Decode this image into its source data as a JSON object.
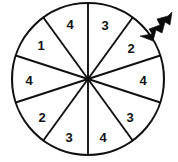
{
  "figure": {
    "name": "spinner-wheel",
    "background_color": "#ffffff",
    "line_color": "#111111",
    "fill_color": "#ffffff",
    "pointer": {
      "name": "arrow-pointer",
      "color": "#0b0b0b",
      "points_to_sector_index": 1,
      "points_to_value": "2",
      "direction": "down-left"
    }
  },
  "chart_data": {
    "type": "pie",
    "title": "",
    "xlabel": "",
    "ylabel": "",
    "legend": [],
    "grid": false,
    "center": {
      "x": 88,
      "y": 79
    },
    "radius": 76,
    "sector_count": 10,
    "categories": [
      "1",
      "2",
      "3",
      "4"
    ],
    "values": [
      1,
      2,
      3,
      4
    ],
    "counts": [
      1,
      2,
      3,
      4
    ],
    "labels_clockwise_from_top": [
      "3",
      "2",
      "4",
      "3",
      "4",
      "3",
      "2",
      "4",
      "1",
      "4"
    ],
    "sectors": [
      {
        "index": 0,
        "label": "3",
        "start_angle": 270,
        "end_angle": 306,
        "label_x": 105,
        "label_y": 25
      },
      {
        "index": 1,
        "label": "2",
        "start_angle": 306,
        "end_angle": 342,
        "label_x": 131,
        "label_y": 48
      },
      {
        "index": 2,
        "label": "4",
        "start_angle": 342,
        "end_angle": 18,
        "label_x": 143,
        "label_y": 80
      },
      {
        "index": 3,
        "label": "3",
        "start_angle": 18,
        "end_angle": 54,
        "label_x": 130,
        "label_y": 117
      },
      {
        "index": 4,
        "label": "4",
        "start_angle": 54,
        "end_angle": 90,
        "label_x": 103,
        "label_y": 137
      },
      {
        "index": 5,
        "label": "3",
        "start_angle": 90,
        "end_angle": 126,
        "label_x": 69,
        "label_y": 137
      },
      {
        "index": 6,
        "label": "2",
        "start_angle": 126,
        "end_angle": 162,
        "label_x": 42,
        "label_y": 117
      },
      {
        "index": 7,
        "label": "4",
        "start_angle": 162,
        "end_angle": 198,
        "label_x": 29,
        "label_y": 80
      },
      {
        "index": 8,
        "label": "1",
        "start_angle": 198,
        "end_angle": 234,
        "label_x": 41,
        "label_y": 45
      },
      {
        "index": 9,
        "label": "4",
        "start_angle": 234,
        "end_angle": 270,
        "label_x": 70,
        "label_y": 24
      }
    ]
  }
}
